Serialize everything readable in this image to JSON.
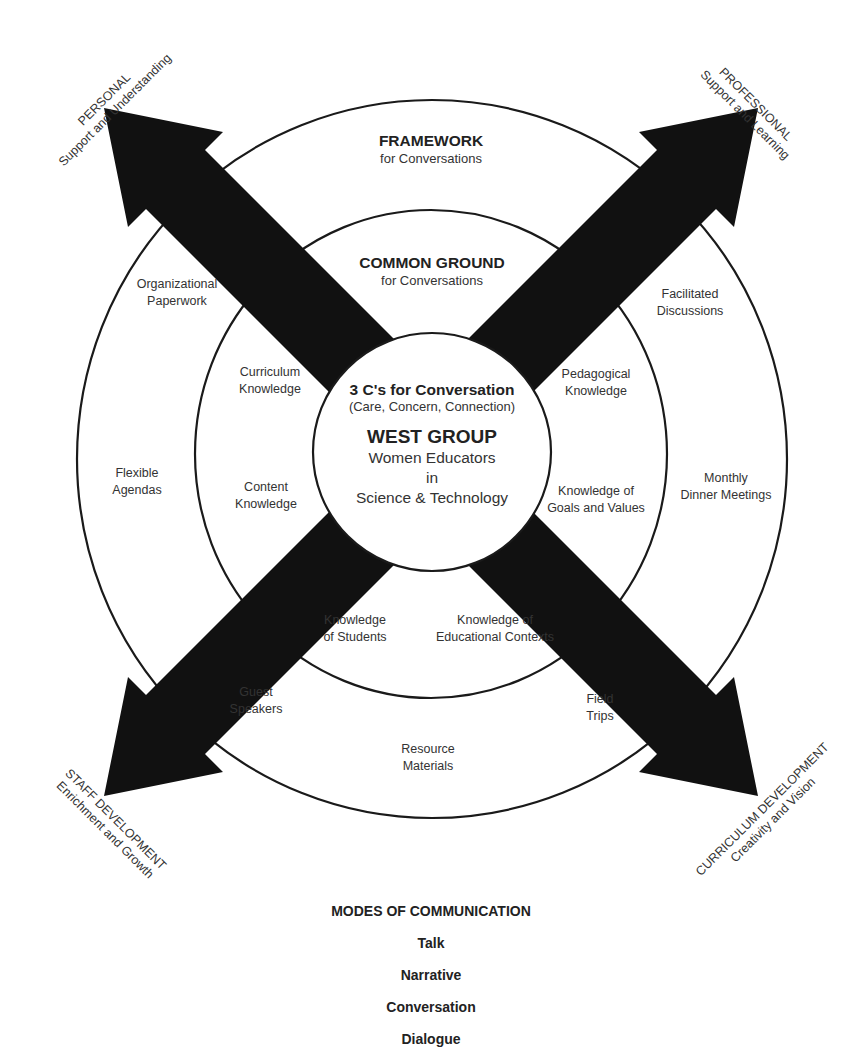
{
  "diagram": {
    "colors": {
      "arrow": "#111111",
      "line": "#1a1a1a",
      "text": "#333333",
      "background": "#ffffff"
    },
    "rings": {
      "outer": {
        "title": "FRAMEWORK",
        "subtitle": "for Conversations"
      },
      "middle": {
        "title": "COMMON GROUND",
        "subtitle": "for Conversations"
      },
      "center": {
        "heading": "3 C's for Conversation",
        "heading_sub": "(Care, Concern, Connection)",
        "group_name": "WEST GROUP",
        "group_line1": "Women Educators",
        "group_line2": "in",
        "group_line3": "Science & Technology"
      }
    },
    "framework_items": [
      {
        "line1": "Organizational",
        "line2": "Paperwork"
      },
      {
        "line1": "Facilitated",
        "line2": "Discussions"
      },
      {
        "line1": "Flexible",
        "line2": "Agendas"
      },
      {
        "line1": "Monthly",
        "line2": "Dinner Meetings"
      },
      {
        "line1": "Guest",
        "line2": "Speakers"
      },
      {
        "line1": "Field",
        "line2": "Trips"
      },
      {
        "line1": "Resource",
        "line2": "Materials"
      }
    ],
    "common_ground_items": [
      {
        "line1": "Curriculum",
        "line2": "Knowledge"
      },
      {
        "line1": "Pedagogical",
        "line2": "Knowledge"
      },
      {
        "line1": "Content",
        "line2": "Knowledge"
      },
      {
        "line1": "Knowledge of",
        "line2": "Goals and Values"
      },
      {
        "line1": "Knowledge",
        "line2": "of Students"
      },
      {
        "line1": "Knowledge of",
        "line2": "Educational Contexts"
      }
    ],
    "arrows": [
      {
        "direction": "up-left",
        "title": "PERSONAL",
        "subtitle": "Support and Understanding"
      },
      {
        "direction": "up-right",
        "title": "PROFESSIONAL",
        "subtitle": "Support and Learning"
      },
      {
        "direction": "down-left",
        "title": "STAFF DEVELOPMENT",
        "subtitle": "Enrichment and Growth"
      },
      {
        "direction": "down-right",
        "title": "CURRICULUM DEVELOPMENT",
        "subtitle": "Creativity and Vision"
      }
    ],
    "modes": {
      "heading": "MODES OF COMMUNICATION",
      "items": [
        "Talk",
        "Narrative",
        "Conversation",
        "Dialogue"
      ]
    }
  }
}
